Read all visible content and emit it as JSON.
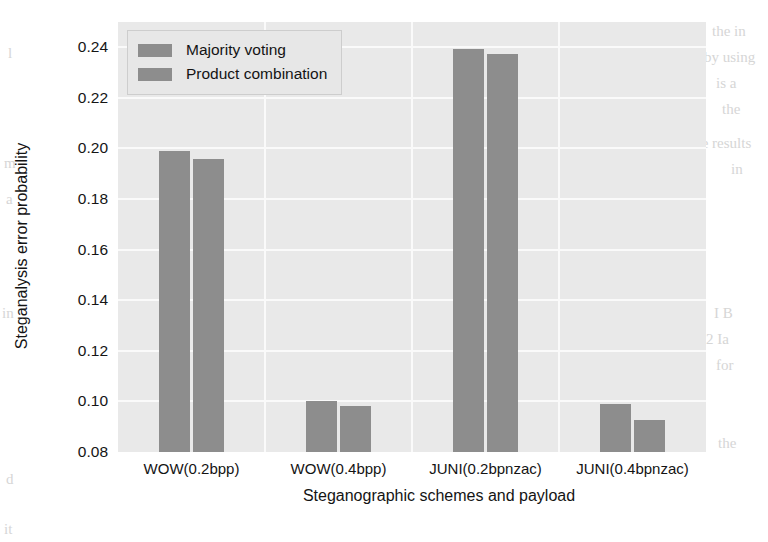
{
  "chart_data": {
    "type": "bar",
    "title": "",
    "xlabel": "Steganographic schemes and payload",
    "ylabel": "Steganalysis error probability",
    "categories": [
      "WOW(0.2bpp)",
      "WOW(0.4bpp)",
      "JUNI(0.2bpnzac)",
      "JUNI(0.4bpnzac)"
    ],
    "series": [
      {
        "name": "Majority voting",
        "values": [
          0.199,
          0.1,
          0.2395,
          0.099
        ]
      },
      {
        "name": "Product combination",
        "values": [
          0.196,
          0.098,
          0.2375,
          0.0925
        ]
      }
    ],
    "ylim": [
      0.08,
      0.25
    ],
    "yticks": [
      "0.08",
      "0.10",
      "0.12",
      "0.14",
      "0.16",
      "0.18",
      "0.20",
      "0.22",
      "0.24"
    ],
    "ytick_values": [
      0.08,
      0.1,
      0.12,
      0.14,
      0.16,
      0.18,
      0.2,
      0.22,
      0.24
    ],
    "grid": true,
    "legend_position": "upper left",
    "series_color": "#8d8d8d",
    "plot_background": "#e9e9e9",
    "gridline_color": "#fafafa"
  },
  "legend": {
    "items": [
      {
        "label": "Majority voting"
      },
      {
        "label": "Product combination"
      }
    ]
  },
  "page_bleed": {
    "lines": [
      {
        "text": "the in",
        "x": 712,
        "y": 18
      },
      {
        "text": "by using",
        "x": 704,
        "y": 44
      },
      {
        "text": "is a",
        "x": 716,
        "y": 70
      },
      {
        "text": "the",
        "x": 722,
        "y": 96
      },
      {
        "text": "the results",
        "x": 690,
        "y": 130
      },
      {
        "text": "in",
        "x": 731,
        "y": 156
      },
      {
        "text": "I B",
        "x": 714,
        "y": 300
      },
      {
        "text": "2 Ia",
        "x": 706,
        "y": 326
      },
      {
        "text": "for",
        "x": 716,
        "y": 352
      },
      {
        "text": "the",
        "x": 718,
        "y": 430
      },
      {
        "text": "l",
        "x": 8,
        "y": 40
      },
      {
        "text": "m",
        "x": 4,
        "y": 150
      },
      {
        "text": "a",
        "x": 6,
        "y": 186
      },
      {
        "text": "in",
        "x": 2,
        "y": 300
      },
      {
        "text": "d",
        "x": 6,
        "y": 466
      },
      {
        "text": "it",
        "x": 4,
        "y": 516
      }
    ]
  }
}
